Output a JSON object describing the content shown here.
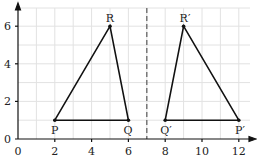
{
  "diagram": {
    "type": "coordinate-grid-reflection",
    "x_ticks": [
      "0",
      "2",
      "4",
      "6",
      "8",
      "10",
      "12"
    ],
    "y_ticks": [
      "0",
      "2",
      "4",
      "6"
    ],
    "mirror_line": "x = 7",
    "triangle_original": {
      "points": [
        {
          "label": "P",
          "x": 2,
          "y": 1
        },
        {
          "label": "Q",
          "x": 6,
          "y": 1
        },
        {
          "label": "R",
          "x": 5,
          "y": 6
        }
      ]
    },
    "triangle_image": {
      "points": [
        {
          "label": "P′",
          "x": 12,
          "y": 1
        },
        {
          "label": "Q′",
          "x": 8,
          "y": 1
        },
        {
          "label": "R′",
          "x": 9,
          "y": 6
        }
      ]
    }
  },
  "labels": {
    "P": "P",
    "Q": "Q",
    "R": "R",
    "P2": "P′",
    "Q2": "Q′",
    "R2": "R′",
    "x0": "0",
    "x2": "2",
    "x4": "4",
    "x6": "6",
    "x8": "8",
    "x10": "10",
    "x12": "12",
    "y0": "0",
    "y2": "2",
    "y4": "4",
    "y6": "6"
  }
}
